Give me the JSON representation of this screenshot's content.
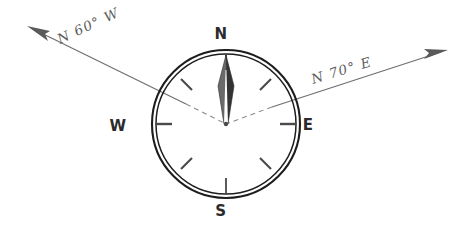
{
  "figure": {
    "background_color": "#ffffff",
    "ink_color": "#1d1d1d",
    "ray_color": "#6e6e6e",
    "dashed_color": "#8a8a8a"
  },
  "compass": {
    "center": {
      "x": 226,
      "y": 124
    },
    "radius_outer": 74,
    "radius_inner": 70,
    "cardinals": [
      {
        "key": "north",
        "label": "N",
        "x": 221,
        "y": 39
      },
      {
        "key": "east",
        "label": "E",
        "x": 308,
        "y": 130
      },
      {
        "key": "south",
        "label": "S",
        "x": 221,
        "y": 216
      },
      {
        "key": "west",
        "label": "W",
        "x": 118,
        "y": 131
      }
    ],
    "tick_angles_deg": [
      0,
      45,
      90,
      135,
      180,
      225,
      270,
      315
    ],
    "needle": {
      "points_to": "N",
      "tip_y": 55,
      "color_light": "#6a6a6a",
      "color_dark": "#333333"
    }
  },
  "bearings": [
    {
      "key": "n60w",
      "label": "N 60° W",
      "direction": "northwest",
      "label_x": 60,
      "label_y": 44,
      "label_rotation_deg": -25,
      "line": {
        "x1": 226,
        "y1": 124,
        "x2": 34,
        "y2": 30
      },
      "arrow_at": {
        "x": 34,
        "y": 30
      }
    },
    {
      "key": "n70e",
      "label": "N 70° E",
      "direction": "northeast",
      "label_x": 313,
      "label_y": 84,
      "label_rotation_deg": -17,
      "line": {
        "x1": 226,
        "y1": 124,
        "x2": 443,
        "y2": 53
      },
      "arrow_at": {
        "x": 443,
        "y": 53
      }
    }
  ]
}
